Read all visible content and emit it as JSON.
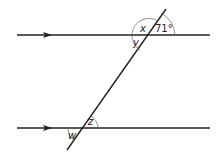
{
  "diagram": {
    "type": "parallel-lines-transversal",
    "labels": {
      "x": "x",
      "y": "y",
      "angle_71": "71°",
      "z": "z",
      "w": "w"
    },
    "given_angle_degrees": 71,
    "parallel_markers": "arrow",
    "colors": {
      "line": "#222222",
      "arc": "#666666",
      "background": "#ffffff"
    }
  }
}
